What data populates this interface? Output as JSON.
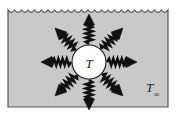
{
  "figure": {
    "type": "physics-diagram",
    "canvas": {
      "width": 181,
      "height": 117
    },
    "enclosure": {
      "name": "surroundings-enclosure",
      "fill_color": "#c9c9c9",
      "border_color": "#555555",
      "x": 8,
      "y": 6,
      "width": 160,
      "height": 101,
      "top_edge_style": "scalloped-wave",
      "top_edge_wave_count": 24,
      "top_edge_wave_amplitude": 4
    },
    "body": {
      "name": "radiating-body",
      "label": "T",
      "shape": "circle",
      "cx": 89,
      "cy": 62,
      "r": 17,
      "fill_color": "#ffffff",
      "stroke_color": "#1a1a1a"
    },
    "ambient": {
      "name": "ambient-temperature-label",
      "label_base": "T",
      "label_subscript": "∞",
      "x": 146,
      "y": 92
    },
    "rays": {
      "name": "radiation-rays",
      "count": 8,
      "color": "#111111",
      "style": "zigzag-wave-arrow",
      "angles_deg": [
        90,
        135,
        180,
        225,
        270,
        315,
        0,
        45
      ],
      "inner_radius": 18,
      "outer_radius": 48,
      "zigzag_segments": 9,
      "zigzag_amplitude": 3.2,
      "arrow_half_width": 5.5,
      "arrow_length": 11
    }
  }
}
